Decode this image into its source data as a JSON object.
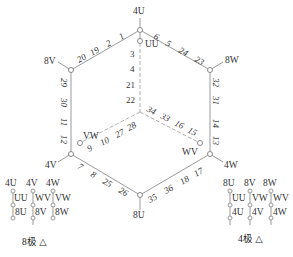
{
  "diagram": {
    "type": "winding-connection-diagram",
    "vertices": {
      "top": "4U",
      "upper_left": "8V",
      "upper_right": "8W",
      "lower_left": "4V",
      "lower_right": "4W",
      "bottom": "8U"
    },
    "inner_terminals": {
      "top": "UU",
      "left": "VW",
      "right": "WV"
    },
    "edges": {
      "top_left": [
        "20",
        "19",
        "2",
        "1"
      ],
      "top_right": [
        "6",
        "5",
        "24",
        "23"
      ],
      "left": [
        "29",
        "30",
        "11",
        "12"
      ],
      "right": [
        "32",
        "31",
        "14",
        "13"
      ],
      "bottom_left": [
        "7",
        "8",
        "25",
        "26"
      ],
      "bottom_right": [
        "35",
        "36",
        "18",
        "17"
      ],
      "inner_vertical": [
        "3",
        "4",
        "21",
        "22"
      ],
      "inner_left": [
        "9",
        "10",
        "27",
        "28"
      ],
      "inner_right": [
        "34",
        "33",
        "16",
        "15"
      ]
    },
    "legend_8pole": {
      "top_row": [
        "4U",
        "4V",
        "4W"
      ],
      "mid_row": [
        "UU",
        "WV",
        "VW"
      ],
      "bottom_row": [
        "8U",
        "8V",
        "8W"
      ],
      "caption": "8极 △"
    },
    "legend_4pole": {
      "top_row": [
        "8U",
        "8V",
        "8W"
      ],
      "mid_row": [
        "UU",
        "VW",
        "WV"
      ],
      "bottom_row": [
        "4U",
        "4V",
        "4W"
      ],
      "caption": "4极 △"
    }
  }
}
